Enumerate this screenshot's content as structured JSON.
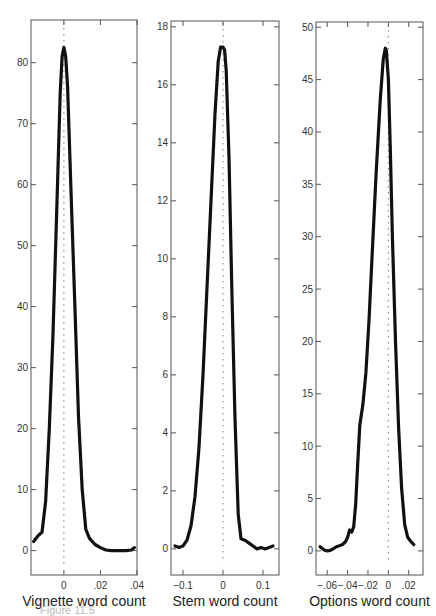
{
  "caption": "Figure 11.5",
  "chart_data": [
    {
      "type": "line",
      "title": "",
      "xlabel": "Vignette word count",
      "ylabel": "",
      "xlim": [
        -0.018,
        0.04
      ],
      "ylim": [
        -4,
        87
      ],
      "xticks": [
        0,
        0.02,
        0.04
      ],
      "xtick_labels": [
        "0",
        ".02",
        ".04"
      ],
      "yticks": [
        0,
        10,
        20,
        30,
        40,
        50,
        60,
        70,
        80
      ],
      "ytick_labels": [
        "0",
        "10",
        "20",
        "30",
        "40",
        "50",
        "60",
        "70",
        "80"
      ],
      "grid": false,
      "reference_line": {
        "x": 0,
        "style": "dotted"
      },
      "x": [
        -0.0165,
        -0.014,
        -0.012,
        -0.01,
        -0.008,
        -0.006,
        -0.004,
        -0.002,
        -0.001,
        0.0,
        0.001,
        0.002,
        0.004,
        0.006,
        0.008,
        0.01,
        0.012,
        0.014,
        0.017,
        0.02,
        0.023,
        0.026,
        0.03,
        0.034,
        0.037,
        0.0385
      ],
      "y": [
        1.5,
        2.5,
        3.0,
        8.0,
        20.0,
        35.0,
        55.0,
        75.0,
        81.0,
        82.5,
        81.0,
        76.0,
        58.0,
        40.0,
        22.0,
        10.0,
        3.5,
        2.0,
        1.0,
        0.5,
        0.1,
        0.0,
        0.0,
        0.0,
        0.1,
        0.5
      ]
    },
    {
      "type": "line",
      "title": "",
      "xlabel": "Stem word count",
      "ylabel": "",
      "xlim": [
        -0.13,
        0.14
      ],
      "ylim": [
        -0.9,
        18.2
      ],
      "xticks": [
        -0.1,
        0,
        0.1
      ],
      "xtick_labels": [
        "-0.1",
        "0",
        "0.1"
      ],
      "yticks": [
        0,
        2,
        4,
        6,
        8,
        10,
        12,
        14,
        16,
        18
      ],
      "ytick_labels": [
        "0",
        "2",
        "4",
        "6",
        "8",
        "10",
        "12",
        "14",
        "16",
        "18"
      ],
      "grid": false,
      "reference_line": {
        "x": 0,
        "style": "dotted"
      },
      "x": [
        -0.12,
        -0.11,
        -0.1,
        -0.09,
        -0.08,
        -0.07,
        -0.06,
        -0.05,
        -0.04,
        -0.03,
        -0.02,
        -0.012,
        -0.006,
        0.0,
        0.004,
        0.008,
        0.015,
        0.022,
        0.03,
        0.038,
        0.045,
        0.055,
        0.065,
        0.075,
        0.085,
        0.095,
        0.105,
        0.115,
        0.125
      ],
      "y": [
        0.1,
        0.05,
        0.1,
        0.3,
        0.8,
        1.8,
        3.5,
        6.0,
        9.0,
        12.0,
        15.0,
        16.8,
        17.3,
        17.3,
        17.2,
        16.5,
        13.5,
        9.0,
        4.5,
        1.2,
        0.35,
        0.3,
        0.2,
        0.1,
        0.0,
        0.05,
        0.0,
        0.05,
        0.1
      ]
    },
    {
      "type": "line",
      "title": "",
      "xlabel": "Options word count",
      "ylabel": "",
      "xlim": [
        -0.071,
        0.034
      ],
      "ylim": [
        -2.3,
        50.5
      ],
      "xticks": [
        -0.06,
        -0.04,
        -0.02,
        0,
        0.02
      ],
      "xtick_labels": [
        "-.06",
        "-.04",
        "-.02",
        "0",
        ".02"
      ],
      "yticks": [
        0,
        5,
        10,
        15,
        20,
        25,
        30,
        35,
        40,
        45,
        50
      ],
      "ytick_labels": [
        "0",
        "5",
        "10",
        "15",
        "20",
        "25",
        "30",
        "35",
        "40",
        "45",
        "50"
      ],
      "grid": false,
      "reference_line": {
        "x": 0,
        "style": "dotted"
      },
      "x": [
        -0.067,
        -0.063,
        -0.06,
        -0.057,
        -0.054,
        -0.051,
        -0.048,
        -0.045,
        -0.042,
        -0.04,
        -0.038,
        -0.036,
        -0.034,
        -0.032,
        -0.03,
        -0.028,
        -0.025,
        -0.022,
        -0.019,
        -0.016,
        -0.012,
        -0.008,
        -0.005,
        -0.003,
        -0.002,
        0.0,
        0.002,
        0.004,
        0.007,
        0.01,
        0.013,
        0.016,
        0.019,
        0.022,
        0.025
      ],
      "y": [
        0.4,
        0.1,
        0.0,
        0.05,
        0.2,
        0.4,
        0.5,
        0.6,
        0.9,
        1.3,
        2.0,
        1.8,
        2.3,
        4.5,
        8.5,
        12.0,
        14.0,
        17.0,
        22.0,
        28.0,
        36.0,
        43.0,
        47.0,
        48.0,
        47.8,
        45.0,
        38.0,
        30.0,
        20.0,
        12.0,
        6.0,
        2.5,
        1.3,
        0.9,
        0.6
      ]
    }
  ]
}
